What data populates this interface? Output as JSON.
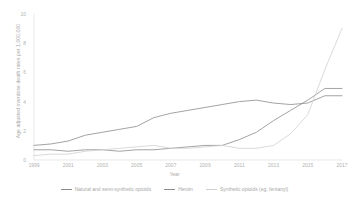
{
  "chart_data": {
    "type": "line",
    "title": "",
    "xlabel": "Year",
    "ylabel": "Age adjusted overdose death rates per 1,000,000",
    "xlim": [
      1999,
      2017
    ],
    "ylim": [
      0,
      10
    ],
    "grid": false,
    "legend_position": "bottom",
    "x": [
      1999,
      2000,
      2001,
      2002,
      2003,
      2004,
      2005,
      2006,
      2007,
      2008,
      2009,
      2010,
      2011,
      2012,
      2013,
      2014,
      2015,
      2016,
      2017
    ],
    "xticks": [
      1999,
      2001,
      2003,
      2005,
      2007,
      2009,
      2011,
      2013,
      2015,
      2017
    ],
    "yticks": [
      0,
      2,
      4,
      6,
      8,
      10
    ],
    "series": [
      {
        "name": "Natural and semi-synthetic opioids",
        "color": "#8c8c8c",
        "values": [
          1.0,
          1.1,
          1.3,
          1.7,
          1.9,
          2.1,
          2.3,
          2.9,
          3.2,
          3.4,
          3.6,
          3.8,
          4.0,
          4.1,
          3.9,
          3.8,
          3.9,
          4.4,
          4.4
        ]
      },
      {
        "name": "Heroin",
        "color": "#8c8c8c",
        "values": [
          0.7,
          0.7,
          0.6,
          0.7,
          0.7,
          0.6,
          0.7,
          0.7,
          0.8,
          0.9,
          1.0,
          1.0,
          1.4,
          1.9,
          2.7,
          3.4,
          4.1,
          4.9,
          4.9
        ]
      },
      {
        "name": "Synthetic opioids (eg, fentanyl)",
        "color": "#d0d0d0",
        "values": [
          0.3,
          0.4,
          0.4,
          0.6,
          0.7,
          0.8,
          0.9,
          1.0,
          0.8,
          0.8,
          0.9,
          1.0,
          0.8,
          0.8,
          1.0,
          1.8,
          3.1,
          6.2,
          9.0
        ]
      }
    ]
  }
}
